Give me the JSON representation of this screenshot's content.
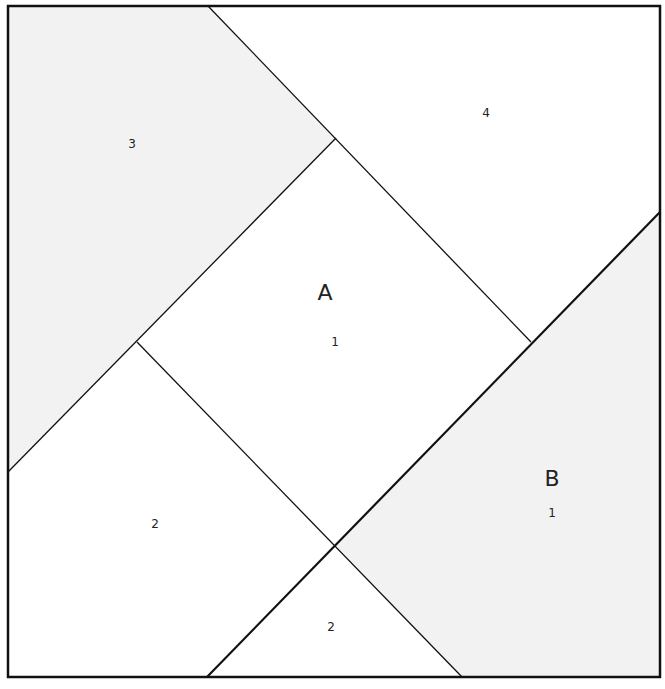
{
  "canvas": {
    "width": 665,
    "height": 689
  },
  "colors": {
    "background": "#ffffff",
    "shaded_fill": "#f2f2f2",
    "line": "#111111"
  },
  "block": {
    "border": {
      "x1": 8,
      "y1": 6,
      "x2": 660,
      "y2": 677,
      "stroke_width": 2.5
    }
  },
  "sections": [
    {
      "id": "A",
      "label": "A",
      "label_pos": [
        325,
        294
      ]
    },
    {
      "id": "B",
      "label": "B",
      "label_pos": [
        552,
        480
      ]
    }
  ],
  "pieces": [
    {
      "id": "A1",
      "section": "A",
      "number": "1",
      "shaded": false,
      "points": [
        [
          336,
          138
        ],
        [
          531,
          342
        ],
        [
          336,
          545
        ],
        [
          137,
          342
        ]
      ],
      "label_pos": [
        335,
        342
      ]
    },
    {
      "id": "A2-left",
      "section": "A",
      "number": "2",
      "shaded": false,
      "points": [
        [
          8,
          472
        ],
        [
          137,
          342
        ],
        [
          336,
          545
        ],
        [
          207,
          677
        ],
        [
          8,
          677
        ]
      ],
      "label_pos": [
        155,
        524
      ]
    },
    {
      "id": "A2-bottom",
      "section": "A",
      "number": "2",
      "shaded": false,
      "points": [
        [
          207,
          677
        ],
        [
          336,
          545
        ],
        [
          462,
          677
        ]
      ],
      "label_pos": [
        331,
        627
      ]
    },
    {
      "id": "A3",
      "section": "A",
      "number": "3",
      "shaded": true,
      "points": [
        [
          8,
          6
        ],
        [
          208,
          6
        ],
        [
          336,
          138
        ],
        [
          137,
          342
        ],
        [
          8,
          472
        ]
      ],
      "label_pos": [
        132,
        144
      ]
    },
    {
      "id": "A4",
      "section": "A",
      "number": "4",
      "shaded": false,
      "points": [
        [
          208,
          6
        ],
        [
          660,
          6
        ],
        [
          660,
          212
        ],
        [
          531,
          342
        ],
        [
          336,
          138
        ]
      ],
      "label_pos": [
        486,
        113
      ]
    },
    {
      "id": "B1",
      "section": "B",
      "number": "1",
      "shaded": true,
      "points": [
        [
          660,
          212
        ],
        [
          660,
          677
        ],
        [
          462,
          677
        ],
        [
          336,
          545
        ],
        [
          531,
          342
        ]
      ],
      "label_pos": [
        552,
        513
      ]
    }
  ],
  "seams": [
    {
      "id": "diag-top-left",
      "x1": 208,
      "y1": 6,
      "x2": 531,
      "y2": 342,
      "stroke_width": 1.3
    },
    {
      "id": "diag-left-up",
      "x1": 8,
      "y1": 472,
      "x2": 336,
      "y2": 138,
      "stroke_width": 1.3
    },
    {
      "id": "diag-center-down",
      "x1": 137,
      "y1": 342,
      "x2": 462,
      "y2": 677,
      "stroke_width": 1.3
    },
    {
      "id": "section-seam-AB",
      "x1": 207,
      "y1": 677,
      "x2": 660,
      "y2": 212,
      "stroke_width": 2.2
    }
  ]
}
